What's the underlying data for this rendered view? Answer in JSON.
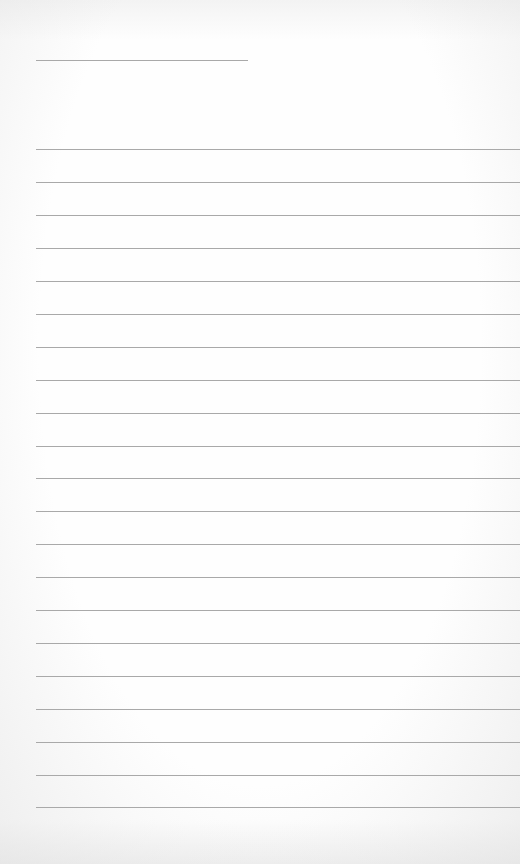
{
  "page": {
    "type": "lined-paper",
    "width": 520,
    "height": 864,
    "background_color": "#fdfdfd",
    "line_color": "#a9a9a9"
  },
  "title_line": {
    "y": 60,
    "x_start": 36,
    "x_end": 248
  },
  "ruled_lines": {
    "x_start": 36,
    "x_end": 520,
    "y_positions": [
      149,
      182,
      215,
      248,
      281,
      314,
      347,
      380,
      413,
      446,
      478,
      511,
      544,
      577,
      610,
      643,
      676,
      709,
      742,
      775,
      807
    ]
  }
}
